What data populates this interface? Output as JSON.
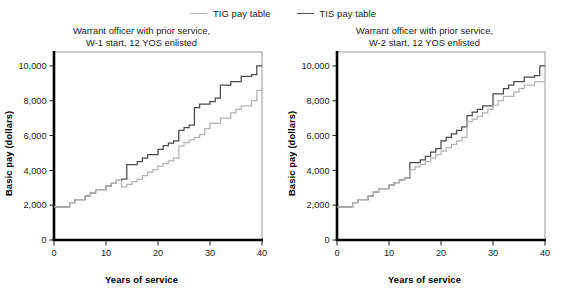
{
  "legend": {
    "position": "top-center",
    "items": [
      {
        "label": "TIG pay table",
        "color": "#b4b4b4",
        "series_key": "tig"
      },
      {
        "label": "TIS pay table",
        "color": "#4a4a4a",
        "series_key": "tis"
      }
    ]
  },
  "axis": {
    "xlabel": "Years of service",
    "ylabel": "Basic pay (dollars)",
    "xticks": [
      0,
      10,
      20,
      30,
      40
    ],
    "xtick_labels": [
      "0",
      "10",
      "20",
      "30",
      "40"
    ],
    "yticks": [
      0,
      2000,
      4000,
      6000,
      8000,
      10000
    ],
    "ytick_labels": [
      "0",
      "2,000",
      "4,000",
      "6,000",
      "8,000",
      "10,000"
    ],
    "xlim": [
      0,
      40
    ],
    "ylim": [
      0,
      10800
    ],
    "grid": false
  },
  "chart_data": [
    {
      "type": "line",
      "line_style": "step",
      "panel": "left",
      "title": "Warrant officer with prior service,\nW-1 start, 12 YOS enlisted",
      "title_lines": [
        "Warrant officer with prior service,",
        "W-1 start, 12 YOS enlisted"
      ],
      "xlabel": "Years of service",
      "ylabel": "Basic pay (dollars)",
      "xlim": [
        0,
        40
      ],
      "ylim": [
        0,
        10800
      ],
      "series": [
        {
          "name": "TIS pay table",
          "color": "#4a4a4a",
          "x": [
            0,
            2,
            3,
            4,
            6,
            7,
            8,
            10,
            11,
            12,
            13,
            14,
            16,
            17,
            18,
            20,
            21,
            22,
            23,
            24,
            25,
            26,
            27,
            28,
            30,
            31,
            32,
            34,
            36,
            38,
            39,
            40
          ],
          "y": [
            1900,
            1900,
            2150,
            2320,
            2520,
            2700,
            2900,
            3100,
            3250,
            3420,
            3500,
            4330,
            4500,
            4700,
            4900,
            5200,
            5420,
            5560,
            5700,
            6300,
            6450,
            6600,
            7600,
            7800,
            7950,
            8150,
            8900,
            9100,
            9400,
            9500,
            10000,
            10000
          ]
        },
        {
          "name": "TIG pay table",
          "color": "#b4b4b4",
          "x": [
            0,
            2,
            3,
            4,
            6,
            7,
            8,
            10,
            11,
            12,
            13,
            14,
            15,
            16,
            17,
            18,
            19,
            20,
            21,
            22,
            23,
            24,
            25,
            26,
            27,
            28,
            29,
            30,
            32,
            34,
            35,
            36,
            38,
            39,
            40
          ],
          "y": [
            1900,
            1900,
            2150,
            2320,
            2520,
            2700,
            2900,
            3100,
            3250,
            3420,
            3050,
            3200,
            3350,
            3500,
            3700,
            3900,
            4050,
            4250,
            4400,
            4550,
            4700,
            5400,
            5600,
            5750,
            5900,
            6050,
            6400,
            6700,
            7000,
            7300,
            7500,
            7700,
            8000,
            8600,
            8600
          ]
        }
      ]
    },
    {
      "type": "line",
      "line_style": "step",
      "panel": "right",
      "title": "Warrant officer with prior service,\nW-2 start, 12 YOS enlisted",
      "title_lines": [
        "Warrant officer with prior service,",
        "W-2 start, 12 YOS enlisted"
      ],
      "xlabel": "Years of service",
      "ylabel": "Basic pay (dollars)",
      "xlim": [
        0,
        40
      ],
      "ylim": [
        0,
        10800
      ],
      "series": [
        {
          "name": "TIS pay table",
          "color": "#4a4a4a",
          "x": [
            0,
            2,
            3,
            4,
            6,
            7,
            8,
            10,
            11,
            12,
            13,
            14,
            16,
            17,
            18,
            19,
            20,
            21,
            22,
            23,
            24,
            25,
            26,
            27,
            28,
            30,
            32,
            33,
            34,
            36,
            38,
            39,
            40
          ],
          "y": [
            1900,
            1900,
            2150,
            2320,
            2520,
            2750,
            2950,
            3150,
            3300,
            3450,
            3550,
            4450,
            4600,
            4800,
            5050,
            5250,
            5700,
            5900,
            6100,
            6300,
            6500,
            7150,
            7350,
            7500,
            7700,
            8400,
            8700,
            8900,
            9100,
            9350,
            9450,
            10000,
            10000
          ]
        },
        {
          "name": "TIG pay table",
          "color": "#b4b4b4",
          "x": [
            0,
            2,
            3,
            4,
            6,
            7,
            8,
            10,
            11,
            12,
            13,
            14,
            15,
            16,
            17,
            18,
            19,
            20,
            21,
            22,
            23,
            24,
            25,
            26,
            27,
            28,
            29,
            30,
            31,
            32,
            34,
            35,
            36,
            38,
            39,
            40
          ],
          "y": [
            1900,
            1900,
            2150,
            2320,
            2520,
            2750,
            2950,
            3150,
            3300,
            3450,
            3550,
            4050,
            4200,
            4350,
            4500,
            4700,
            4900,
            5100,
            5300,
            5500,
            5700,
            5900,
            6800,
            6950,
            7100,
            7300,
            7500,
            7750,
            8000,
            8250,
            8500,
            8700,
            8900,
            9100,
            9100,
            9100
          ]
        }
      ]
    }
  ]
}
